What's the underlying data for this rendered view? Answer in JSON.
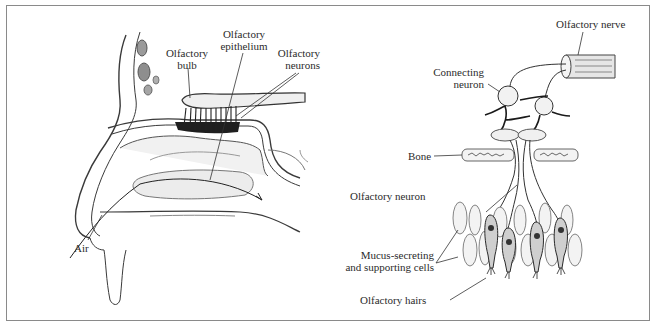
{
  "figure": {
    "left_panel": {
      "title": "Nasal cavity (sagittal view)",
      "labels": {
        "olfactory_bulb": [
          "Olfactory",
          "bulb"
        ],
        "olfactory_epithelium": [
          "Olfactory",
          "epithelium"
        ],
        "olfactory_neurons": [
          "Olfactory",
          "neurons"
        ],
        "air": "Air"
      }
    },
    "right_panel": {
      "title": "Olfactory pathway detail",
      "labels": {
        "olfactory_nerve": "Olfactory nerve",
        "connecting_neuron": [
          "Connecting",
          "neuron"
        ],
        "bone": "Bone",
        "olfactory_neuron": "Olfactory neuron",
        "mucus_cells": [
          "Mucus-secreting",
          "and supporting cells"
        ],
        "olfactory_hairs": "Olfactory hairs"
      }
    },
    "colors": {
      "frame": "#8a8a8a",
      "ink": "#2b2b2b",
      "shade": "#bdbdbd",
      "dark": "#1a1a1a"
    }
  }
}
